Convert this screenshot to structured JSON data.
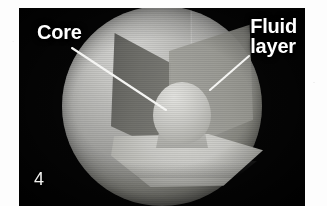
{
  "figure": {
    "number": "4",
    "caption_visible": false,
    "panel_background_color": "#050505",
    "page_background_color": "#ffffff",
    "label_color": "#ffffff",
    "leader_line_color": "#f4f4f2"
  },
  "labels": [
    {
      "id": "core",
      "text": "Core",
      "lines": [
        "Core"
      ],
      "position": "top-left",
      "has_leader_line": true,
      "leader": {
        "from_x": 72,
        "from_y": 48,
        "to_x": 166,
        "to_y": 110
      }
    },
    {
      "id": "fluid-layer",
      "text": "Fluid\nlayer",
      "lines": [
        "Fluid",
        "layer"
      ],
      "position": "top-right",
      "has_leader_line": true,
      "leader": {
        "from_x": 249,
        "from_y": 56,
        "to_x": 210,
        "to_y": 90
      }
    }
  ],
  "diagram": {
    "outer_shell_name": "Fluid layer",
    "inner_body_name": "Core",
    "sphere_center_x": 162,
    "sphere_center_y": 106,
    "sphere_diameter": 200,
    "core_diameter": 58,
    "cutaway": "front quarter wedge removed",
    "colors": {
      "outer_shell_light": "#d8d8d6",
      "outer_shell_dark": "#2f2f2c",
      "wedge_wall_left": "#6e6e69",
      "wedge_wall_right": "#9b9b95",
      "wedge_floor": "#cacac6",
      "core_light": "#e3e3e0",
      "core_dark": "#90908b"
    }
  }
}
